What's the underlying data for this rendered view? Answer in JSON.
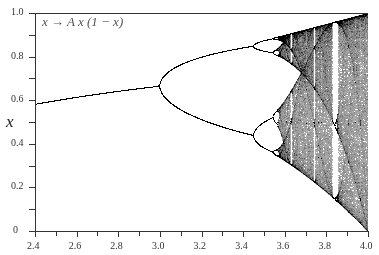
{
  "chart_data": {
    "type": "scatter",
    "title": "",
    "annotation": "x → A x (1 − x)",
    "xlabel": "",
    "ylabel": "x",
    "xlim": [
      2.4,
      4.0
    ],
    "ylim": [
      0,
      1.0
    ],
    "x_ticks": [
      "2.4",
      "2.6",
      "2.8",
      "3.0",
      "3.2",
      "3.4",
      "3.6",
      "3.8",
      "4.0"
    ],
    "y_ticks": [
      "0",
      "0.2",
      "0.4",
      "0.6",
      "0.8",
      "1.0"
    ],
    "grid": false,
    "series": [
      {
        "name": "fixed point",
        "x": [
          2.4,
          2.6,
          2.8,
          3.0
        ],
        "values": [
          0.583,
          0.615,
          0.643,
          0.667
        ]
      },
      {
        "name": "period-2 upper",
        "x": [
          3.0,
          3.2,
          3.4
        ],
        "values": [
          0.667,
          0.799,
          0.842
        ]
      },
      {
        "name": "period-2 lower",
        "x": [
          3.0,
          3.2,
          3.4
        ],
        "values": [
          0.667,
          0.513,
          0.452
        ]
      }
    ],
    "color": "#000000"
  },
  "axes": {
    "formula": "x → A x (1 − x)",
    "y_axis_label": "x"
  }
}
